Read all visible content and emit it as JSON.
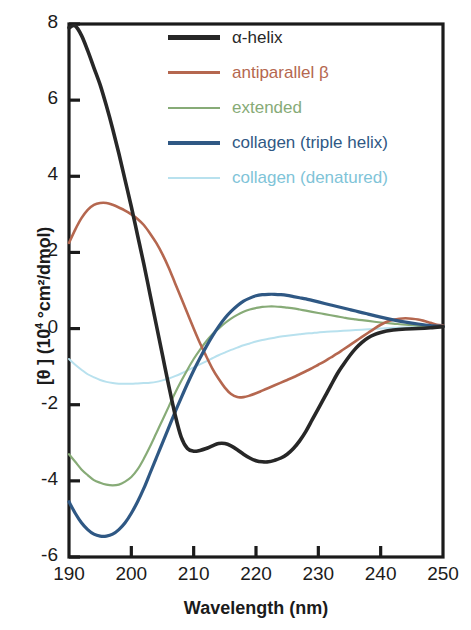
{
  "chart_data": {
    "type": "line",
    "title": "",
    "xlabel": "Wavelength (nm)",
    "ylabel_html": "[θ ] (10⁴ °cm²/dmol)",
    "ylabel_main": "[θ ] (10",
    "ylabel_sup": "4",
    "ylabel_tail": " °cm²/dmol)",
    "xlim": [
      190,
      250
    ],
    "ylim": [
      -6,
      8
    ],
    "xticks": [
      190,
      200,
      210,
      220,
      230,
      240,
      250
    ],
    "yticks": [
      -6,
      -4,
      -2,
      0,
      2,
      4,
      6,
      8
    ],
    "grid": false,
    "legend_position": "top-center-inside",
    "series": [
      {
        "name": "α-helix",
        "color": "#272727",
        "width": 3.6,
        "points": [
          [
            190,
            7.9
          ],
          [
            191,
            7.95
          ],
          [
            192,
            7.7
          ],
          [
            193,
            7.3
          ],
          [
            194,
            6.85
          ],
          [
            195,
            6.4
          ],
          [
            196,
            5.85
          ],
          [
            197,
            5.25
          ],
          [
            198,
            4.6
          ],
          [
            199,
            3.9
          ],
          [
            200,
            3.2
          ],
          [
            201,
            2.45
          ],
          [
            202,
            1.7
          ],
          [
            203,
            0.9
          ],
          [
            204,
            0.1
          ],
          [
            205,
            -0.7
          ],
          [
            206,
            -1.5
          ],
          [
            207,
            -2.25
          ],
          [
            208,
            -2.85
          ],
          [
            209,
            -3.15
          ],
          [
            210,
            -3.22
          ],
          [
            211,
            -3.2
          ],
          [
            212,
            -3.15
          ],
          [
            213,
            -3.08
          ],
          [
            214,
            -3.02
          ],
          [
            215,
            -3.02
          ],
          [
            216,
            -3.08
          ],
          [
            217,
            -3.18
          ],
          [
            218,
            -3.3
          ],
          [
            219,
            -3.4
          ],
          [
            220,
            -3.47
          ],
          [
            221,
            -3.5
          ],
          [
            222,
            -3.5
          ],
          [
            223,
            -3.46
          ],
          [
            224,
            -3.4
          ],
          [
            225,
            -3.3
          ],
          [
            226,
            -3.15
          ],
          [
            227,
            -2.95
          ],
          [
            228,
            -2.7
          ],
          [
            229,
            -2.4
          ],
          [
            230,
            -2.1
          ],
          [
            231,
            -1.8
          ],
          [
            232,
            -1.5
          ],
          [
            233,
            -1.2
          ],
          [
            234,
            -0.95
          ],
          [
            235,
            -0.72
          ],
          [
            236,
            -0.52
          ],
          [
            237,
            -0.36
          ],
          [
            238,
            -0.24
          ],
          [
            239,
            -0.16
          ],
          [
            240,
            -0.1
          ],
          [
            242,
            -0.04
          ],
          [
            244,
            -0.01
          ],
          [
            246,
            0.0
          ],
          [
            248,
            0.02
          ],
          [
            250,
            0.05
          ]
        ]
      },
      {
        "name": "antiparallel β",
        "color": "#b5674f",
        "width": 2.6,
        "points": [
          [
            190,
            2.25
          ],
          [
            191,
            2.6
          ],
          [
            192,
            2.9
          ],
          [
            193,
            3.12
          ],
          [
            194,
            3.25
          ],
          [
            195,
            3.3
          ],
          [
            196,
            3.3
          ],
          [
            197,
            3.25
          ],
          [
            198,
            3.18
          ],
          [
            199,
            3.1
          ],
          [
            200,
            3.0
          ],
          [
            201,
            2.88
          ],
          [
            202,
            2.72
          ],
          [
            203,
            2.5
          ],
          [
            204,
            2.25
          ],
          [
            205,
            1.95
          ],
          [
            206,
            1.6
          ],
          [
            207,
            1.2
          ],
          [
            208,
            0.8
          ],
          [
            209,
            0.4
          ],
          [
            210,
            0.0
          ],
          [
            211,
            -0.38
          ],
          [
            212,
            -0.72
          ],
          [
            213,
            -1.05
          ],
          [
            214,
            -1.32
          ],
          [
            215,
            -1.55
          ],
          [
            216,
            -1.72
          ],
          [
            217,
            -1.8
          ],
          [
            218,
            -1.8
          ],
          [
            219,
            -1.76
          ],
          [
            220,
            -1.7
          ],
          [
            221,
            -1.63
          ],
          [
            222,
            -1.56
          ],
          [
            223,
            -1.49
          ],
          [
            224,
            -1.42
          ],
          [
            225,
            -1.35
          ],
          [
            226,
            -1.28
          ],
          [
            227,
            -1.2
          ],
          [
            228,
            -1.12
          ],
          [
            229,
            -1.04
          ],
          [
            230,
            -0.95
          ],
          [
            231,
            -0.86
          ],
          [
            232,
            -0.76
          ],
          [
            233,
            -0.66
          ],
          [
            234,
            -0.55
          ],
          [
            235,
            -0.44
          ],
          [
            236,
            -0.33
          ],
          [
            237,
            -0.22
          ],
          [
            238,
            -0.11
          ],
          [
            239,
            0.0
          ],
          [
            240,
            0.1
          ],
          [
            241,
            0.18
          ],
          [
            242,
            0.23
          ],
          [
            243,
            0.26
          ],
          [
            244,
            0.27
          ],
          [
            245,
            0.26
          ],
          [
            246,
            0.24
          ],
          [
            247,
            0.2
          ],
          [
            248,
            0.15
          ],
          [
            249,
            0.1
          ],
          [
            250,
            0.08
          ]
        ]
      },
      {
        "name": "extended",
        "color": "#87ab77",
        "width": 2.2,
        "points": [
          [
            190,
            -3.3
          ],
          [
            191,
            -3.5
          ],
          [
            192,
            -3.7
          ],
          [
            193,
            -3.85
          ],
          [
            194,
            -3.98
          ],
          [
            195,
            -4.05
          ],
          [
            196,
            -4.1
          ],
          [
            197,
            -4.12
          ],
          [
            198,
            -4.1
          ],
          [
            199,
            -4.02
          ],
          [
            200,
            -3.9
          ],
          [
            201,
            -3.7
          ],
          [
            202,
            -3.42
          ],
          [
            203,
            -3.1
          ],
          [
            204,
            -2.75
          ],
          [
            205,
            -2.4
          ],
          [
            206,
            -2.05
          ],
          [
            207,
            -1.7
          ],
          [
            208,
            -1.38
          ],
          [
            209,
            -1.08
          ],
          [
            210,
            -0.8
          ],
          [
            211,
            -0.56
          ],
          [
            212,
            -0.34
          ],
          [
            213,
            -0.15
          ],
          [
            214,
            0.0
          ],
          [
            215,
            0.14
          ],
          [
            216,
            0.26
          ],
          [
            217,
            0.36
          ],
          [
            218,
            0.44
          ],
          [
            219,
            0.5
          ],
          [
            220,
            0.54
          ],
          [
            221,
            0.57
          ],
          [
            222,
            0.58
          ],
          [
            223,
            0.58
          ],
          [
            224,
            0.57
          ],
          [
            225,
            0.55
          ],
          [
            226,
            0.53
          ],
          [
            227,
            0.5
          ],
          [
            228,
            0.47
          ],
          [
            229,
            0.44
          ],
          [
            230,
            0.41
          ],
          [
            231,
            0.38
          ],
          [
            232,
            0.35
          ],
          [
            233,
            0.32
          ],
          [
            234,
            0.29
          ],
          [
            235,
            0.26
          ],
          [
            236,
            0.24
          ],
          [
            237,
            0.22
          ],
          [
            238,
            0.2
          ],
          [
            239,
            0.18
          ],
          [
            240,
            0.16
          ],
          [
            242,
            0.13
          ],
          [
            244,
            0.1
          ],
          [
            246,
            0.08
          ],
          [
            248,
            0.06
          ],
          [
            250,
            0.05
          ]
        ]
      },
      {
        "name": "collagen (triple helix)",
        "color": "#2f5884",
        "width": 3.2,
        "points": [
          [
            190,
            -4.55
          ],
          [
            191,
            -4.85
          ],
          [
            192,
            -5.1
          ],
          [
            193,
            -5.28
          ],
          [
            194,
            -5.4
          ],
          [
            195,
            -5.45
          ],
          [
            196,
            -5.45
          ],
          [
            197,
            -5.4
          ],
          [
            198,
            -5.28
          ],
          [
            199,
            -5.1
          ],
          [
            200,
            -4.85
          ],
          [
            201,
            -4.55
          ],
          [
            202,
            -4.2
          ],
          [
            203,
            -3.8
          ],
          [
            204,
            -3.4
          ],
          [
            205,
            -3.0
          ],
          [
            206,
            -2.6
          ],
          [
            207,
            -2.2
          ],
          [
            208,
            -1.82
          ],
          [
            209,
            -1.45
          ],
          [
            210,
            -1.1
          ],
          [
            211,
            -0.78
          ],
          [
            212,
            -0.48
          ],
          [
            213,
            -0.2
          ],
          [
            214,
            0.05
          ],
          [
            215,
            0.27
          ],
          [
            216,
            0.45
          ],
          [
            217,
            0.6
          ],
          [
            218,
            0.72
          ],
          [
            219,
            0.8
          ],
          [
            220,
            0.86
          ],
          [
            221,
            0.89
          ],
          [
            222,
            0.9
          ],
          [
            223,
            0.9
          ],
          [
            224,
            0.89
          ],
          [
            225,
            0.87
          ],
          [
            226,
            0.84
          ],
          [
            227,
            0.81
          ],
          [
            228,
            0.78
          ],
          [
            229,
            0.74
          ],
          [
            230,
            0.7
          ],
          [
            231,
            0.66
          ],
          [
            232,
            0.62
          ],
          [
            233,
            0.58
          ],
          [
            234,
            0.54
          ],
          [
            235,
            0.5
          ],
          [
            236,
            0.46
          ],
          [
            237,
            0.42
          ],
          [
            238,
            0.38
          ],
          [
            239,
            0.34
          ],
          [
            240,
            0.3
          ],
          [
            242,
            0.23
          ],
          [
            244,
            0.17
          ],
          [
            246,
            0.12
          ],
          [
            248,
            0.08
          ],
          [
            250,
            0.06
          ]
        ]
      },
      {
        "name": "collagen (denatured)",
        "color": "#b8e1ee",
        "width": 2.0,
        "points": [
          [
            190,
            -0.8
          ],
          [
            191,
            -0.95
          ],
          [
            192,
            -1.08
          ],
          [
            193,
            -1.2
          ],
          [
            194,
            -1.28
          ],
          [
            195,
            -1.35
          ],
          [
            196,
            -1.4
          ],
          [
            197,
            -1.43
          ],
          [
            198,
            -1.45
          ],
          [
            199,
            -1.45
          ],
          [
            200,
            -1.45
          ],
          [
            201,
            -1.44
          ],
          [
            202,
            -1.43
          ],
          [
            203,
            -1.42
          ],
          [
            204,
            -1.4
          ],
          [
            205,
            -1.36
          ],
          [
            206,
            -1.31
          ],
          [
            207,
            -1.25
          ],
          [
            208,
            -1.18
          ],
          [
            209,
            -1.1
          ],
          [
            210,
            -1.02
          ],
          [
            211,
            -0.94
          ],
          [
            212,
            -0.86
          ],
          [
            213,
            -0.78
          ],
          [
            214,
            -0.7
          ],
          [
            215,
            -0.63
          ],
          [
            216,
            -0.56
          ],
          [
            217,
            -0.5
          ],
          [
            218,
            -0.44
          ],
          [
            219,
            -0.39
          ],
          [
            220,
            -0.34
          ],
          [
            221,
            -0.3
          ],
          [
            222,
            -0.27
          ],
          [
            223,
            -0.24
          ],
          [
            224,
            -0.21
          ],
          [
            225,
            -0.19
          ],
          [
            226,
            -0.17
          ],
          [
            227,
            -0.15
          ],
          [
            228,
            -0.13
          ],
          [
            229,
            -0.12
          ],
          [
            230,
            -0.1
          ],
          [
            232,
            -0.08
          ],
          [
            234,
            -0.06
          ],
          [
            236,
            -0.04
          ],
          [
            238,
            -0.02
          ],
          [
            240,
            0.0
          ],
          [
            242,
            0.02
          ],
          [
            244,
            0.03
          ],
          [
            246,
            0.04
          ],
          [
            248,
            0.05
          ],
          [
            250,
            0.05
          ]
        ]
      }
    ]
  },
  "legend": {
    "items": [
      {
        "label": "α-helix",
        "color": "#272727",
        "thickness": 5
      },
      {
        "label": "antiparallel β",
        "color": "#b5674f",
        "thickness": 3
      },
      {
        "label": "extended",
        "color": "#87ab77",
        "thickness": 2
      },
      {
        "label": "collagen (triple helix)",
        "color": "#2f5884",
        "thickness": 4
      },
      {
        "label": "collagen (denatured)",
        "color": "#b8e1ee",
        "thickness": 2
      }
    ]
  },
  "axes": {
    "x_tick_labels": [
      "190",
      "200",
      "210",
      "220",
      "230",
      "240",
      "250"
    ],
    "y_tick_labels": [
      "8",
      "6",
      "4",
      "2",
      "0",
      "-2",
      "-4",
      "-6"
    ],
    "x_title": "Wavelength (nm)",
    "y_title_main": "[θ ] (10",
    "y_title_sup": "4",
    "y_title_tail": " °cm²/dmol)"
  },
  "colors": {
    "axis": "#1b1b1b",
    "background": "#ffffff"
  }
}
